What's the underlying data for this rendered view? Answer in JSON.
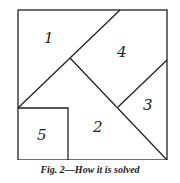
{
  "figure": {
    "caption": "Fig. 2—How it is solved",
    "pieces": [
      {
        "id": "1",
        "label": "1"
      },
      {
        "id": "2",
        "label": "2"
      },
      {
        "id": "3",
        "label": "3"
      },
      {
        "id": "4",
        "label": "4"
      },
      {
        "id": "5",
        "label": "5"
      }
    ]
  }
}
